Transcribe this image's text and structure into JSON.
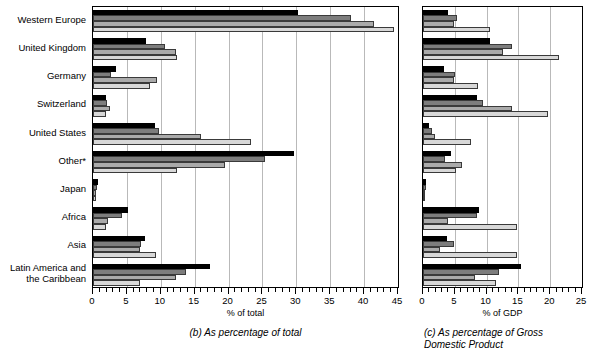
{
  "figure": {
    "categories": [
      "Western Europe",
      "United Kingdom",
      "Germany",
      "Switzerland",
      "United States",
      "Other*",
      "Japan",
      "Africa",
      "Asia",
      "Latin America and\nthe Caribbean"
    ],
    "series_fills": [
      "#000000",
      "#7d7d7d",
      "#aaaaaa",
      "#d8d8d8"
    ],
    "panel_b": {
      "caption": "(b) As percentage of total",
      "axis_title": "% of total",
      "ticklabels": [
        "0",
        "5",
        "10",
        "15",
        "20",
        "25",
        "30",
        "35",
        "40",
        "45"
      ]
    },
    "panel_c": {
      "caption": "(c) As percentage of Gross\nDomestic Product",
      "axis_title": "% of GDP",
      "ticklabels": [
        "0",
        "5",
        "10",
        "15",
        "20",
        "25"
      ]
    }
  },
  "chart_data": [
    {
      "type": "bar",
      "title": "(b) As percentage of total",
      "orientation": "horizontal",
      "xlabel": "% of total",
      "ylabel": "",
      "xlim": [
        0,
        45
      ],
      "grid": true,
      "legend": "none",
      "categories": [
        "Western Europe",
        "United Kingdom",
        "Germany",
        "Switzerland",
        "United States",
        "Other*",
        "Japan",
        "Africa",
        "Asia",
        "Latin America and the Caribbean"
      ],
      "series": [
        {
          "name": "series-1",
          "color": "#000000",
          "values": [
            30.2,
            7.8,
            3.4,
            1.9,
            9.1,
            29.7,
            0.7,
            5.1,
            7.7,
            17.2
          ]
        },
        {
          "name": "series-2",
          "color": "#7d7d7d",
          "values": [
            38.0,
            10.6,
            2.6,
            2.1,
            9.8,
            25.4,
            0.6,
            4.3,
            7.1,
            13.7
          ]
        },
        {
          "name": "series-3",
          "color": "#aaaaaa",
          "values": [
            41.5,
            12.2,
            9.4,
            2.5,
            16.0,
            19.5,
            0.5,
            2.2,
            6.9,
            12.2
          ]
        },
        {
          "name": "series-4",
          "color": "#d8d8d8",
          "values": [
            44.4,
            12.4,
            8.4,
            1.9,
            23.3,
            12.4,
            0.5,
            1.9,
            9.3,
            6.9
          ]
        }
      ]
    },
    {
      "type": "bar",
      "title": "(c) As percentage of Gross Domestic Product",
      "orientation": "horizontal",
      "xlabel": "% of GDP",
      "ylabel": "",
      "xlim": [
        0,
        25
      ],
      "grid": true,
      "legend": "none",
      "categories": [
        "Western Europe",
        "United Kingdom",
        "Germany",
        "Switzerland",
        "United States",
        "Other*",
        "Japan",
        "Africa",
        "Asia",
        "Latin America and the Caribbean"
      ],
      "series": [
        {
          "name": "series-1",
          "color": "#000000",
          "values": [
            3.9,
            10.6,
            3.3,
            8.5,
            1.0,
            4.4,
            0.4,
            8.8,
            3.7,
            15.4
          ]
        },
        {
          "name": "series-2",
          "color": "#7d7d7d",
          "values": [
            5.4,
            14.0,
            5.1,
            9.5,
            1.4,
            3.4,
            0.4,
            8.5,
            4.9,
            12.0
          ]
        },
        {
          "name": "series-3",
          "color": "#aaaaaa",
          "values": [
            4.8,
            12.6,
            4.8,
            14.0,
            1.9,
            6.2,
            0.3,
            3.9,
            2.6,
            8.2
          ]
        },
        {
          "name": "series-4",
          "color": "#d8d8d8",
          "values": [
            10.6,
            21.4,
            8.7,
            19.7,
            7.5,
            5.2,
            0.3,
            14.8,
            14.8,
            11.5
          ]
        }
      ]
    }
  ]
}
